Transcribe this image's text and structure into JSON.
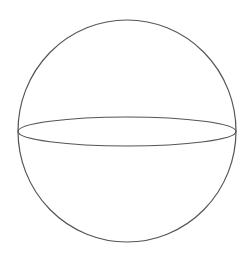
{
  "diagram": {
    "type": "sphere",
    "stroke_color": "#555555",
    "background": "#ffffff",
    "outline": {
      "cx": 127,
      "cy": 131,
      "rx": 109,
      "ry": 111
    },
    "equator": {
      "cx": 127,
      "cy": 131.5,
      "rx": 109,
      "ry": 14.5
    }
  }
}
